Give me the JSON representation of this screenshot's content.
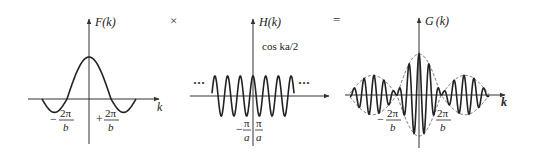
{
  "figure": {
    "operators": {
      "times": "×",
      "equals": "="
    }
  },
  "panels": [
    {
      "id": "F",
      "title_main": "F",
      "title_arg": "(k)",
      "axis_var": "k",
      "tick_labels": [
        {
          "sign": "−",
          "num": "2π",
          "den": "b"
        },
        {
          "sign": "+",
          "num": "2π",
          "den": "b"
        }
      ]
    },
    {
      "id": "H",
      "title_main": "H",
      "title_arg": "(k)",
      "annotation": "cos ka/2",
      "ellipsis_left": "···",
      "ellipsis_right": "···",
      "tick_labels": [
        {
          "sign": "−",
          "num": "π",
          "den": "a"
        },
        {
          "sign": "",
          "num": "π",
          "den": "a"
        }
      ]
    },
    {
      "id": "G",
      "title_main": "G",
      "title_arg": "(k)",
      "axis_var": "k",
      "tick_labels": [
        {
          "sign": "−",
          "num": "2π",
          "den": "b"
        },
        {
          "sign": "",
          "num": "2π",
          "den": "b"
        }
      ]
    }
  ],
  "chart_data": [
    {
      "type": "line",
      "title": "F(k)",
      "xlabel": "k",
      "ylabel": "F(k)",
      "description": "Single-slit-like envelope: central positive lobe with negative side lobes; zeros at ±2π/b",
      "x_ticks": [
        "−2π/b",
        "+2π/b"
      ],
      "series": [
        {
          "name": "F(k)",
          "shape": "sinc-like",
          "zeros": [
            "-2π/b",
            "+2π/b"
          ],
          "peak": 1.0,
          "side_lobe_min": -0.3
        }
      ]
    },
    {
      "type": "line",
      "title": "H(k)",
      "xlabel": "k",
      "ylabel": "H(k)",
      "annotation": "cos ka/2",
      "description": "Periodic cosine extending infinitely (ellipses at both ends)",
      "x_ticks": [
        "−π/a",
        "π/a"
      ],
      "series": [
        {
          "name": "cos ka/2",
          "shape": "cosine",
          "amplitude": 1.0,
          "visible_periods": 6.5
        }
      ]
    },
    {
      "type": "line",
      "title": "G(k)",
      "xlabel": "k",
      "ylabel": "G(k)",
      "description": "Product F(k)·H(k): fast oscillation under dashed envelope ±F(k)",
      "x_ticks": [
        "−2π/b",
        "2π/b"
      ],
      "series": [
        {
          "name": "G(k)",
          "shape": "modulated cosine"
        },
        {
          "name": "envelope",
          "style": "dashed",
          "shape": "±F(k)"
        }
      ]
    }
  ],
  "geometry": {
    "F": {
      "cx": 89,
      "cy": 99,
      "top": 18,
      "bottom": 144,
      "left": 28,
      "right": 160,
      "amp": 42,
      "half": 22,
      "ext": 47
    },
    "H": {
      "cx": 253,
      "cy": 96,
      "top": 18,
      "bottom": 146,
      "left": 190,
      "right": 330,
      "amp": 20,
      "period": 12.7,
      "x0": 212,
      "x1": 294
    },
    "G": {
      "cx": 419,
      "cy": 95,
      "top": 17,
      "bottom": 148,
      "left": 345,
      "right": 506,
      "amp": 41,
      "half": 22,
      "period": 10,
      "x0": 350,
      "x1": 489
    }
  }
}
